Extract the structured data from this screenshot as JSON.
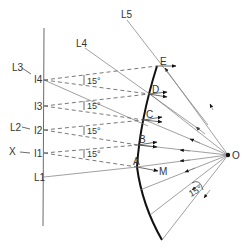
{
  "diagram": {
    "title": "",
    "source_label": "O",
    "reflector_points": [
      "A",
      "B",
      "C",
      "D",
      "E"
    ],
    "image_points": [
      "I1",
      "I2",
      "I3",
      "I4"
    ],
    "axis_label": "X",
    "ray_labels": [
      "L1",
      "L2",
      "L3",
      "L4",
      "L5"
    ],
    "reflected_ray_label": "M",
    "angle_label": "15°",
    "image_angle_labels": [
      "15°",
      "15°",
      "15°",
      "15°"
    ]
  }
}
